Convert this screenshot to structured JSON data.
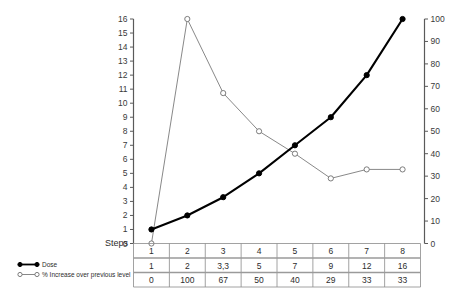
{
  "chart_data": {
    "type": "line",
    "title": "",
    "xlabel": "Steps",
    "ylabel": "",
    "grid": false,
    "legend_position": "bottom-left",
    "categories": [
      "1",
      "2",
      "3",
      "4",
      "5",
      "6",
      "7",
      "8"
    ],
    "x": [
      1,
      2,
      3,
      4,
      5,
      6,
      7,
      8
    ],
    "series": [
      {
        "name": "Dose",
        "axis": "left",
        "marker": "filled-circle",
        "color": "#000000",
        "values": [
          1,
          2,
          3.3,
          5,
          7,
          9,
          12,
          16
        ],
        "labels": [
          "1",
          "2",
          "3,3",
          "5",
          "7",
          "9",
          "12",
          "16"
        ]
      },
      {
        "name": "% Increase over previous level",
        "axis": "right",
        "marker": "open-circle",
        "color": "#7b7b7b",
        "values": [
          0,
          100,
          67,
          50,
          40,
          29,
          33,
          33
        ],
        "labels": [
          "0",
          "100",
          "67",
          "50",
          "40",
          "29",
          "33",
          "33"
        ]
      }
    ],
    "left_axis": {
      "min": 0,
      "max": 16,
      "ticks": [
        0,
        1,
        2,
        3,
        4,
        5,
        6,
        7,
        8,
        9,
        10,
        11,
        12,
        13,
        14,
        15,
        16
      ],
      "tick_labels": [
        "0",
        "1",
        "2",
        "3",
        "4",
        "5",
        "6",
        "7",
        "8",
        "9",
        "10",
        "11",
        "12",
        "13",
        "14",
        "15",
        "16"
      ]
    },
    "right_axis": {
      "min": 0,
      "max": 100,
      "ticks": [
        0,
        10,
        20,
        30,
        40,
        50,
        60,
        70,
        80,
        90,
        100
      ],
      "tick_labels": [
        "0",
        "10",
        "20",
        "30",
        "40",
        "50",
        "60",
        "70",
        "80",
        "90",
        "100"
      ]
    }
  },
  "table": {
    "axis_label": "Steps",
    "rows": [
      {
        "key": "steps",
        "cells": [
          "1",
          "2",
          "3",
          "4",
          "5",
          "6",
          "7",
          "8"
        ]
      },
      {
        "key": "dose",
        "cells": [
          "1",
          "2",
          "3,3",
          "5",
          "7",
          "9",
          "12",
          "16"
        ]
      },
      {
        "key": "pct",
        "cells": [
          "0",
          "100",
          "67",
          "50",
          "40",
          "29",
          "33",
          "33"
        ]
      }
    ]
  },
  "legend": {
    "items": [
      {
        "label": "Dose",
        "marker": "filled-circle",
        "color": "#000000"
      },
      {
        "label": "% Increase over previous level",
        "marker": "open-circle",
        "color": "#7b7b7b"
      }
    ]
  }
}
